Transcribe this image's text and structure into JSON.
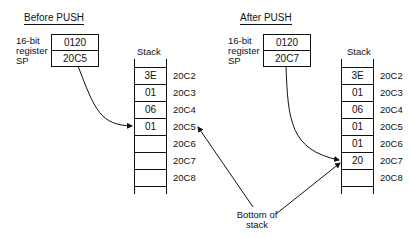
{
  "before": {
    "title": "Before PUSH",
    "register_label": [
      "16-bit",
      "register",
      "SP"
    ],
    "register_values": [
      "0120",
      "20C5"
    ],
    "stack_label": "Stack",
    "cells": [
      "3E",
      "01",
      "06",
      "01",
      "",
      "",
      ""
    ],
    "addresses": [
      "20C2",
      "20C3",
      "20C4",
      "20C5",
      "20C6",
      "20C7",
      "20C8"
    ]
  },
  "after": {
    "title": "After PUSH",
    "register_label": [
      "16-bit",
      "register",
      "SP"
    ],
    "register_values": [
      "0120",
      "20C7"
    ],
    "stack_label": "Stack",
    "cells": [
      "3E",
      "01",
      "06",
      "01",
      "01",
      "20",
      ""
    ],
    "addresses": [
      "20C2",
      "20C3",
      "20C4",
      "20C5",
      "20C6",
      "20C7",
      "20C8"
    ]
  },
  "annotation": {
    "line1": "Bottom of",
    "line2": "stack"
  }
}
